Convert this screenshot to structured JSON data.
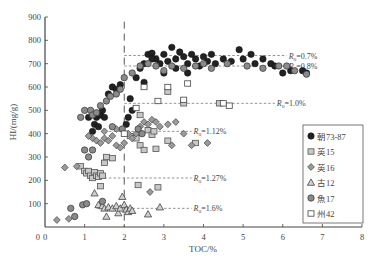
{
  "chart_data": {
    "type": "scatter",
    "title": "",
    "xlabel": "TOC/%",
    "ylabel": "HI/(mg/g)",
    "xlim": [
      0,
      8
    ],
    "ylim": [
      0,
      900
    ],
    "xticks": [
      0,
      1,
      2,
      3,
      4,
      5,
      6,
      7,
      8
    ],
    "yticks": [
      100,
      200,
      300,
      400,
      500,
      600,
      700,
      800,
      900
    ],
    "y_zero_label": "0",
    "grid": false,
    "legend_position": "right-inside",
    "vertical_line": {
      "x": 2,
      "style": "dashed"
    },
    "reference_lines": [
      {
        "label": "Ro=0.7%",
        "y": 735,
        "x_from": 2,
        "x_to": 6.1
      },
      {
        "label": "Ro=0.8%",
        "y": 690,
        "x_from": 2,
        "x_to": 6.1
      },
      {
        "label": "Ro=1.0%",
        "y": 530,
        "x_from": 2,
        "x_to": 5.8
      },
      {
        "label": "Ro=1.12%",
        "y": 410,
        "x_from": 1.5,
        "x_to": 3.7
      },
      {
        "label": "Ro=1.27%",
        "y": 210,
        "x_from": 1.5,
        "x_to": 3.7
      },
      {
        "label": "Ro=1.6%",
        "y": 80,
        "x_from": 1.3,
        "x_to": 3.7
      }
    ],
    "series": [
      {
        "name": "朝73-87",
        "marker": "circle-filled-dark",
        "points": [
          [
            1.2,
            410
          ],
          [
            1.25,
            440
          ],
          [
            1.3,
            470
          ],
          [
            1.35,
            430
          ],
          [
            1.4,
            480
          ],
          [
            1.45,
            500
          ],
          [
            1.5,
            470
          ],
          [
            1.1,
            470
          ],
          [
            1.6,
            570
          ],
          [
            1.7,
            600
          ],
          [
            1.8,
            590
          ],
          [
            1.9,
            610
          ],
          [
            2.05,
            440
          ],
          [
            2.1,
            470
          ],
          [
            2.15,
            550
          ],
          [
            2.2,
            500
          ],
          [
            2.3,
            640
          ],
          [
            2.4,
            680
          ],
          [
            2.5,
            700
          ],
          [
            2.6,
            740
          ],
          [
            2.7,
            745
          ],
          [
            2.8,
            720
          ],
          [
            2.9,
            700
          ],
          [
            3.0,
            740
          ],
          [
            3.1,
            710
          ],
          [
            3.2,
            770
          ],
          [
            3.3,
            720
          ],
          [
            3.4,
            750
          ],
          [
            3.5,
            730
          ],
          [
            3.6,
            700
          ],
          [
            3.7,
            740
          ],
          [
            3.8,
            720
          ],
          [
            3.9,
            690
          ],
          [
            4.0,
            730
          ],
          [
            4.1,
            710
          ],
          [
            4.2,
            740
          ],
          [
            4.3,
            700
          ],
          [
            4.5,
            720
          ],
          [
            4.7,
            710
          ],
          [
            4.9,
            760
          ],
          [
            5.0,
            720
          ],
          [
            5.2,
            740
          ],
          [
            5.3,
            700
          ],
          [
            5.5,
            720
          ],
          [
            5.7,
            700
          ],
          [
            5.8,
            690
          ],
          [
            6.0,
            660
          ],
          [
            6.2,
            670
          ],
          [
            6.5,
            670
          ],
          [
            6.6,
            660
          ],
          [
            2.7,
            720
          ],
          [
            3.3,
            680
          ],
          [
            3.0,
            660
          ],
          [
            2.5,
            620
          ],
          [
            3.6,
            660
          ]
        ]
      },
      {
        "name": "英15",
        "marker": "square-gray",
        "points": [
          [
            0.9,
            260
          ],
          [
            1.0,
            240
          ],
          [
            1.05,
            230
          ],
          [
            1.1,
            240
          ],
          [
            1.15,
            220
          ],
          [
            1.2,
            210
          ],
          [
            1.25,
            235
          ],
          [
            1.3,
            220
          ],
          [
            1.35,
            215
          ],
          [
            1.4,
            230
          ],
          [
            1.45,
            220
          ],
          [
            1.5,
            275
          ],
          [
            1.55,
            300
          ],
          [
            1.7,
            295
          ],
          [
            1.4,
            175
          ],
          [
            2.15,
            390
          ],
          [
            2.3,
            380
          ],
          [
            2.6,
            415
          ],
          [
            2.7,
            395
          ],
          [
            2.75,
            410
          ],
          [
            2.8,
            335
          ],
          [
            2.4,
            350
          ],
          [
            2.5,
            330
          ],
          [
            3.1,
            370
          ],
          [
            3.8,
            360
          ],
          [
            2.35,
            180
          ],
          [
            2.85,
            170
          ],
          [
            3.5,
            530
          ],
          [
            4.4,
            530
          ],
          [
            2.4,
            480
          ],
          [
            3.1,
            580
          ]
        ]
      },
      {
        "name": "英16",
        "marker": "diamond-gray",
        "points": [
          [
            0.3,
            30
          ],
          [
            0.6,
            35
          ],
          [
            0.5,
            255
          ],
          [
            0.8,
            260
          ],
          [
            1.2,
            380
          ],
          [
            1.3,
            370
          ],
          [
            1.4,
            360
          ],
          [
            1.5,
            380
          ],
          [
            1.6,
            370
          ],
          [
            1.7,
            390
          ],
          [
            1.8,
            350
          ],
          [
            1.9,
            340
          ],
          [
            2.0,
            360
          ],
          [
            2.1,
            400
          ],
          [
            2.2,
            380
          ],
          [
            2.3,
            400
          ],
          [
            2.4,
            430
          ],
          [
            2.5,
            450
          ],
          [
            2.6,
            440
          ],
          [
            2.7,
            460
          ],
          [
            2.8,
            450
          ],
          [
            2.9,
            430
          ],
          [
            3.1,
            440
          ],
          [
            3.3,
            450
          ],
          [
            3.5,
            400
          ],
          [
            3.2,
            350
          ],
          [
            2.65,
            150
          ],
          [
            3.7,
            350
          ],
          [
            4.1,
            360
          ],
          [
            1.1,
            390
          ],
          [
            1.5,
            410
          ],
          [
            1.8,
            420
          ]
        ]
      },
      {
        "name": "古12",
        "marker": "triangle-gray",
        "points": [
          [
            1.25,
            145
          ],
          [
            1.35,
            95
          ],
          [
            1.45,
            90
          ],
          [
            1.5,
            80
          ],
          [
            1.55,
            45
          ],
          [
            1.6,
            85
          ],
          [
            1.7,
            80
          ],
          [
            1.8,
            90
          ],
          [
            1.85,
            60
          ],
          [
            1.9,
            80
          ],
          [
            1.95,
            130
          ],
          [
            2.0,
            95
          ],
          [
            2.05,
            75
          ],
          [
            2.1,
            65
          ],
          [
            2.15,
            80
          ],
          [
            2.2,
            70
          ],
          [
            2.6,
            55
          ],
          [
            2.9,
            85
          ]
        ]
      },
      {
        "name": "魚17",
        "marker": "circle-gray",
        "points": [
          [
            0.65,
            80
          ],
          [
            0.75,
            45
          ],
          [
            0.95,
            95
          ],
          [
            1.05,
            100
          ],
          [
            1.45,
            110
          ],
          [
            0.9,
            470
          ],
          [
            1.0,
            500
          ],
          [
            1.15,
            500
          ],
          [
            1.2,
            480
          ],
          [
            1.3,
            490
          ],
          [
            1.4,
            520
          ],
          [
            1.55,
            540
          ],
          [
            1.65,
            560
          ],
          [
            1.8,
            570
          ],
          [
            1.9,
            590
          ],
          [
            2.0,
            640
          ],
          [
            2.2,
            660
          ],
          [
            2.4,
            690
          ],
          [
            2.6,
            700
          ],
          [
            2.8,
            690
          ],
          [
            3.0,
            670
          ],
          [
            3.2,
            690
          ],
          [
            3.5,
            680
          ],
          [
            3.8,
            690
          ],
          [
            4.0,
            700
          ],
          [
            4.2,
            680
          ],
          [
            4.6,
            700
          ],
          [
            5.1,
            690
          ],
          [
            5.5,
            680
          ],
          [
            5.9,
            690
          ],
          [
            6.1,
            690
          ],
          [
            6.3,
            670
          ],
          [
            6.6,
            655
          ],
          [
            1.1,
            300
          ],
          [
            1.0,
            330
          ],
          [
            1.2,
            330
          ],
          [
            1.7,
            430
          ],
          [
            1.95,
            420
          ],
          [
            2.35,
            420
          ],
          [
            2.45,
            400
          ]
        ]
      },
      {
        "name": "州42",
        "marker": "square-open",
        "points": [
          [
            2.0,
            400
          ],
          [
            2.5,
            600
          ],
          [
            3.1,
            600
          ],
          [
            3.6,
            615
          ],
          [
            2.85,
            540
          ],
          [
            3.5,
            545
          ],
          [
            4.5,
            530
          ],
          [
            4.65,
            520
          ],
          [
            2.3,
            510
          ]
        ]
      }
    ]
  },
  "legend": {
    "items": [
      {
        "label": "朝73-87",
        "marker": "circle-filled-dark"
      },
      {
        "label": "英15",
        "marker": "square-gray"
      },
      {
        "label": "英16",
        "marker": "diamond-gray"
      },
      {
        "label": "古12",
        "marker": "triangle-gray"
      },
      {
        "label": "魚17",
        "marker": "circle-gray"
      },
      {
        "label": "州42",
        "marker": "square-open"
      }
    ]
  },
  "colors": {
    "axis": "#444444",
    "dark_marker": "#222222",
    "gray_marker": "#8a8a8a",
    "dash": "#777777"
  }
}
